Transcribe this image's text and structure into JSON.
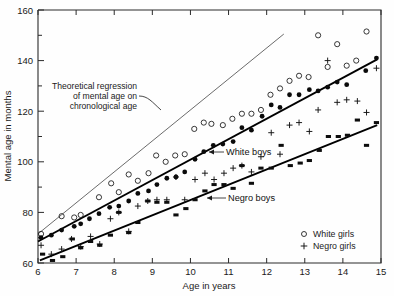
{
  "chart_data": {
    "type": "scatter",
    "title": "",
    "xlabel": "Age in years",
    "ylabel": "Mental age in months",
    "xlim": [
      6,
      15
    ],
    "ylim": [
      60,
      160
    ],
    "xticks": [
      6,
      7,
      8,
      9,
      10,
      11,
      12,
      13,
      14,
      15
    ],
    "xtick_labels": [
      "6",
      "7",
      "8",
      "9",
      "10",
      "11",
      "12",
      "13",
      "14",
      "15"
    ],
    "yticks": [
      60,
      80,
      100,
      120,
      140,
      160
    ],
    "ytick_labels": [
      "60",
      "80",
      "100",
      "120",
      "140",
      "160"
    ],
    "y_minor_ticks": [
      70,
      90,
      110,
      130,
      150
    ],
    "grid": false,
    "legend_position": "lower right",
    "legend": [
      {
        "label": "White girls",
        "marker": "open-circle"
      },
      {
        "label": "Negro girls",
        "marker": "plus"
      }
    ],
    "annotations": [
      {
        "name": "theoretical-regression-note",
        "lines": [
          "Theoretical regression",
          "of mental age on",
          "chronological age"
        ],
        "points_to": {
          "x": 9.2,
          "y": 127
        }
      },
      {
        "name": "white-boys-label",
        "text": "White boys",
        "points_to": {
          "x": 10.55,
          "y": 106.5
        }
      },
      {
        "name": "negro-boys-label",
        "text": "Negro boys",
        "points_to": {
          "x": 10.4,
          "y": 88.5
        }
      }
    ],
    "lines": [
      {
        "name": "theoretical-regression-line",
        "style": "thin-grey",
        "x": [
          6.0,
          12.45
        ],
        "y": [
          71.5,
          150.5
        ]
      },
      {
        "name": "white-boys-fit",
        "style": "thick-black",
        "x": [
          6.0,
          14.9
        ],
        "y": [
          68.5,
          140.5
        ]
      },
      {
        "name": "negro-boys-fit",
        "style": "thick-black",
        "x": [
          6.05,
          14.9
        ],
        "y": [
          61.0,
          114.5
        ]
      }
    ],
    "series": [
      {
        "name": "White girls",
        "marker": "open-circle",
        "points": [
          [
            6.08,
            71.5
          ],
          [
            6.62,
            78.5
          ],
          [
            6.95,
            78.0
          ],
          [
            7.12,
            79.0
          ],
          [
            7.6,
            86.0
          ],
          [
            7.92,
            91.5
          ],
          [
            8.12,
            88.0
          ],
          [
            8.38,
            95.0
          ],
          [
            8.62,
            92.5
          ],
          [
            8.9,
            95.5
          ],
          [
            9.1,
            102.5
          ],
          [
            9.35,
            100.0
          ],
          [
            9.6,
            102.5
          ],
          [
            9.85,
            103.0
          ],
          [
            10.1,
            113.0
          ],
          [
            10.35,
            115.5
          ],
          [
            10.55,
            115.0
          ],
          [
            10.85,
            114.5
          ],
          [
            11.1,
            117.0
          ],
          [
            11.35,
            119.0
          ],
          [
            11.6,
            119.0
          ],
          [
            11.85,
            120.5
          ],
          [
            12.1,
            126.5
          ],
          [
            12.35,
            129.0
          ],
          [
            12.6,
            132.0
          ],
          [
            12.85,
            134.0
          ],
          [
            13.1,
            133.5
          ],
          [
            13.35,
            150.0
          ],
          [
            13.6,
            137.5
          ],
          [
            13.85,
            146.5
          ],
          [
            14.1,
            138.0
          ],
          [
            14.35,
            140.0
          ],
          [
            14.62,
            151.5
          ]
        ]
      },
      {
        "name": "White boys",
        "marker": "filled-circle",
        "points": [
          [
            6.08,
            70.0
          ],
          [
            6.35,
            71.0
          ],
          [
            6.62,
            73.0
          ],
          [
            6.95,
            74.5
          ],
          [
            7.12,
            75.5
          ],
          [
            7.35,
            77.5
          ],
          [
            7.6,
            79.5
          ],
          [
            7.88,
            82.0
          ],
          [
            8.12,
            82.5
          ],
          [
            8.38,
            84.5
          ],
          [
            8.62,
            87.5
          ],
          [
            8.9,
            88.5
          ],
          [
            9.12,
            91.0
          ],
          [
            9.38,
            93.5
          ],
          [
            9.62,
            94.0
          ],
          [
            9.85,
            96.0
          ],
          [
            10.12,
            101.0
          ],
          [
            10.35,
            104.0
          ],
          [
            10.6,
            106.5
          ],
          [
            10.85,
            107.0
          ],
          [
            11.12,
            108.0
          ],
          [
            11.35,
            113.5
          ],
          [
            11.6,
            112.5
          ],
          [
            11.88,
            118.0
          ],
          [
            12.12,
            122.5
          ],
          [
            12.35,
            121.5
          ],
          [
            12.6,
            126.5
          ],
          [
            12.85,
            126.5
          ],
          [
            13.12,
            128.5
          ],
          [
            13.35,
            128.0
          ],
          [
            13.6,
            129.5
          ],
          [
            13.85,
            131.5
          ],
          [
            14.1,
            130.5
          ],
          [
            14.6,
            136.0
          ],
          [
            14.88,
            141.0
          ]
        ]
      },
      {
        "name": "Negro girls",
        "marker": "plus",
        "points": [
          [
            6.08,
            67.0
          ],
          [
            6.35,
            63.5
          ],
          [
            6.62,
            65.5
          ],
          [
            6.88,
            69.5
          ],
          [
            7.12,
            66.5
          ],
          [
            7.38,
            70.5
          ],
          [
            7.62,
            67.5
          ],
          [
            7.9,
            77.5
          ],
          [
            8.12,
            80.0
          ],
          [
            8.38,
            72.5
          ],
          [
            8.62,
            82.5
          ],
          [
            8.88,
            84.5
          ],
          [
            9.12,
            85.0
          ],
          [
            9.38,
            85.0
          ],
          [
            9.62,
            94.0
          ],
          [
            9.85,
            85.0
          ],
          [
            10.12,
            93.0
          ],
          [
            10.38,
            95.5
          ],
          [
            10.62,
            93.0
          ],
          [
            10.88,
            95.5
          ],
          [
            11.12,
            97.5
          ],
          [
            11.35,
            98.5
          ],
          [
            11.6,
            96.0
          ],
          [
            11.85,
            102.0
          ],
          [
            12.12,
            111.5
          ],
          [
            12.35,
            103.0
          ],
          [
            12.6,
            114.5
          ],
          [
            12.85,
            115.5
          ],
          [
            13.12,
            112.0
          ],
          [
            13.35,
            120.5
          ],
          [
            13.6,
            140.0
          ],
          [
            13.85,
            123.5
          ],
          [
            14.1,
            124.5
          ],
          [
            14.38,
            124.0
          ],
          [
            14.62,
            119.5
          ],
          [
            14.88,
            137.0
          ]
        ]
      },
      {
        "name": "Negro boys",
        "marker": "small-square",
        "points": [
          [
            6.12,
            63.5
          ],
          [
            6.38,
            61.0
          ],
          [
            6.65,
            62.5
          ],
          [
            6.9,
            69.5
          ],
          [
            7.12,
            66.0
          ],
          [
            7.38,
            68.5
          ],
          [
            7.62,
            67.0
          ],
          [
            7.9,
            71.0
          ],
          [
            8.12,
            80.0
          ],
          [
            8.38,
            72.0
          ],
          [
            8.62,
            76.0
          ],
          [
            8.88,
            84.5
          ],
          [
            9.12,
            84.0
          ],
          [
            9.38,
            84.0
          ],
          [
            9.62,
            79.0
          ],
          [
            9.88,
            81.5
          ],
          [
            10.12,
            85.0
          ],
          [
            10.38,
            88.5
          ],
          [
            10.62,
            91.0
          ],
          [
            10.88,
            91.0
          ],
          [
            11.12,
            89.5
          ],
          [
            11.35,
            98.5
          ],
          [
            11.6,
            91.5
          ],
          [
            11.85,
            97.5
          ],
          [
            12.12,
            97.5
          ],
          [
            12.38,
            106.5
          ],
          [
            12.62,
            98.5
          ],
          [
            12.88,
            99.5
          ],
          [
            13.12,
            100.5
          ],
          [
            13.38,
            104.5
          ],
          [
            13.62,
            110.0
          ],
          [
            13.88,
            110.0
          ],
          [
            14.12,
            110.5
          ],
          [
            14.38,
            116.5
          ],
          [
            14.62,
            106.5
          ],
          [
            14.88,
            115.5
          ]
        ]
      }
    ]
  },
  "colors": {
    "marker_black": "#0a0a0a",
    "theory_line": "#5a5a5a",
    "fit_line": "#000000",
    "axis": "#2b2b2b",
    "background": "#fefefe"
  }
}
